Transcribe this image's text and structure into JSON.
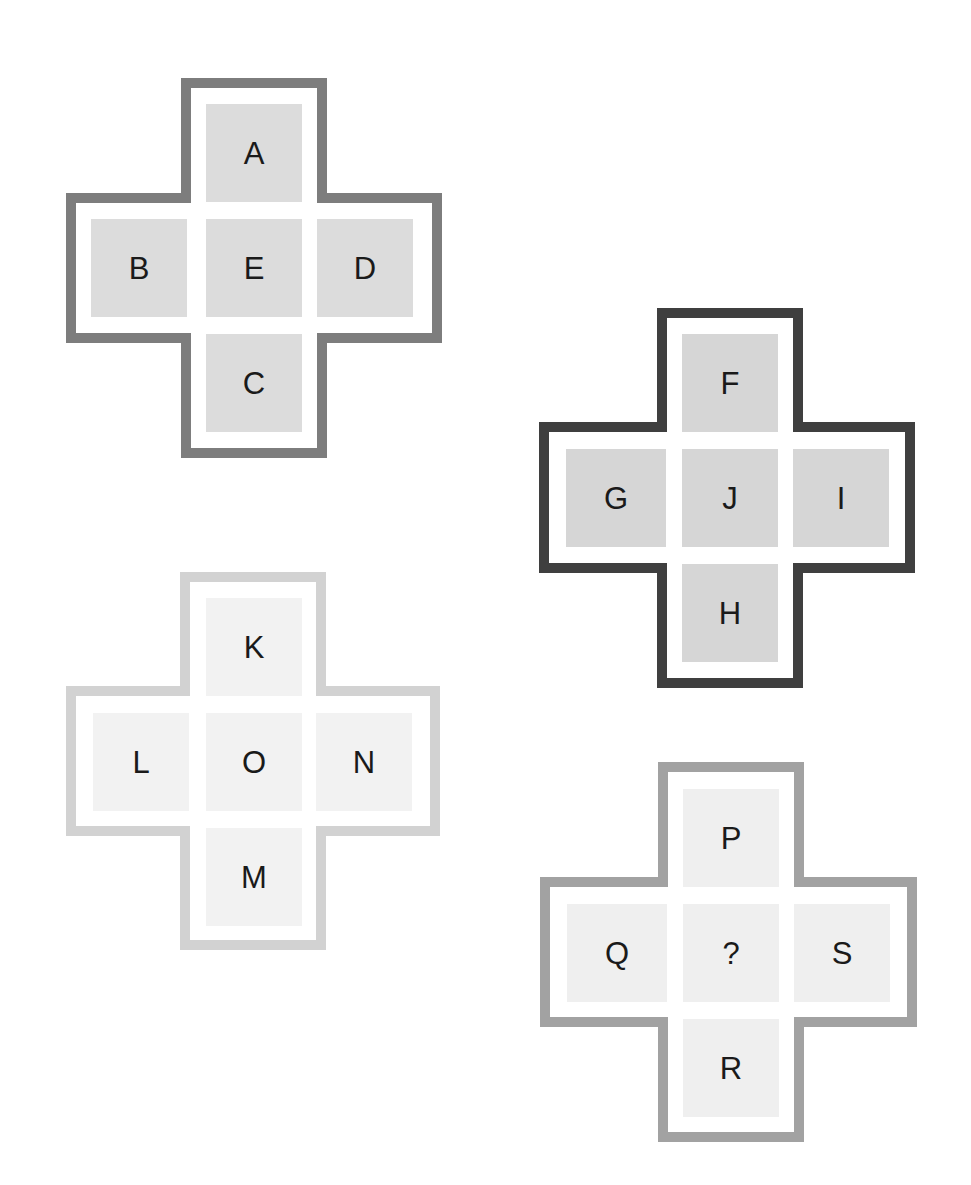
{
  "puzzle": {
    "crosses": [
      {
        "id": "cross-1",
        "position": {
          "left": 66,
          "top": 78
        },
        "border_color": "#7d7d7d",
        "cell_color": "#dcdcdc",
        "cells": {
          "top": "A",
          "left": "B",
          "center": "E",
          "right": "D",
          "bottom": "C"
        }
      },
      {
        "id": "cross-2",
        "position": {
          "left": 539,
          "top": 308
        },
        "border_color": "#3f3f3f",
        "cell_color": "#d6d6d6",
        "cells": {
          "top": "F",
          "left": "G",
          "center": "J",
          "right": "I",
          "bottom": "H"
        }
      },
      {
        "id": "cross-3",
        "position": {
          "left": 66,
          "top": 572
        },
        "border_color": "#d2d2d2",
        "cell_color": "#f2f2f2",
        "cells": {
          "top": "K",
          "left": "L",
          "center": "O",
          "right": "N",
          "bottom": "M"
        }
      },
      {
        "id": "cross-4",
        "position": {
          "left": 540,
          "top": 762
        },
        "border_color": "#a2a2a2",
        "cell_color": "#efefef",
        "cells": {
          "top": "P",
          "left": "Q",
          "center": "?",
          "right": "S",
          "bottom": "R"
        }
      }
    ]
  }
}
